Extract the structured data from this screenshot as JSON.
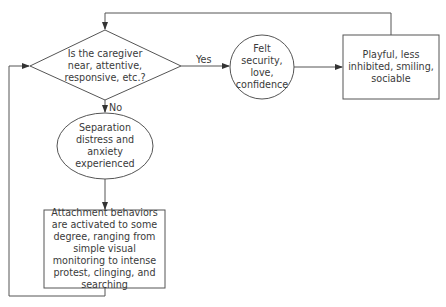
{
  "diagram": {
    "type": "flowchart",
    "nodes": {
      "decision": {
        "shape": "diamond",
        "text": "Is the caregiver near, attentive, responsive, etc.?"
      },
      "felt_security": {
        "shape": "circle",
        "text": "Felt security, love, confidence"
      },
      "playful": {
        "shape": "rectangle",
        "text": "Playful, less inhibited, smiling, sociable"
      },
      "separation": {
        "shape": "ellipse",
        "text": "Separation distress and anxiety experienced"
      },
      "attachment": {
        "shape": "rectangle",
        "text": "Attachment behaviors are activated to some degree, ranging from simple visual monitoring to intense protest, clinging, and searching"
      }
    },
    "edges": [
      {
        "from": "decision",
        "to": "felt_security",
        "label": "Yes"
      },
      {
        "from": "felt_security",
        "to": "playful",
        "label": ""
      },
      {
        "from": "playful",
        "to": "decision",
        "label": ""
      },
      {
        "from": "decision",
        "to": "separation",
        "label": "No"
      },
      {
        "from": "separation",
        "to": "attachment",
        "label": ""
      },
      {
        "from": "attachment",
        "to": "decision",
        "label": ""
      }
    ],
    "labels": {
      "yes": "Yes",
      "no": "No"
    },
    "colors": {
      "stroke": "#555555",
      "text": "#3a3a3a",
      "background": "#ffffff"
    }
  }
}
